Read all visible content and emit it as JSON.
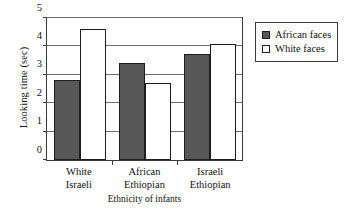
{
  "chart_data": {
    "type": "bar",
    "title": "",
    "xlabel": "Ethnicity of infants",
    "ylabel": "Looking time (sec)",
    "categories": [
      "White Israeli",
      "African Ethiopian",
      "Israeli Ethiopian"
    ],
    "category_lines": [
      [
        "White",
        "Israeli"
      ],
      [
        "African",
        "Ethiopian"
      ],
      [
        "Israeli",
        "Ethiopian"
      ]
    ],
    "series": [
      {
        "name": "African faces",
        "color": "#585858",
        "values": [
          2.8,
          3.4,
          3.75
        ]
      },
      {
        "name": "White faces",
        "color": "#ffffff",
        "values": [
          4.6,
          2.7,
          4.1
        ]
      }
    ],
    "ylim": [
      0,
      5
    ],
    "yticks": [
      0,
      1,
      2,
      3,
      4,
      5
    ],
    "ytick_labels": [
      "0",
      "1",
      "2",
      "3",
      "4",
      "5"
    ],
    "grid": true,
    "legend_position": "right"
  },
  "legend": {
    "items": [
      {
        "label": "African faces",
        "swatch": "dark-swatch-icon"
      },
      {
        "label": "White faces",
        "swatch": "light-swatch-icon"
      }
    ]
  }
}
